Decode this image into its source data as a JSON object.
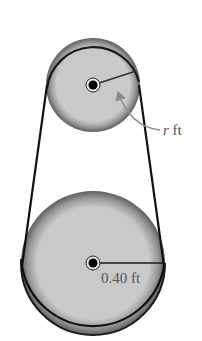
{
  "diagram": {
    "type": "belt-and-pulley",
    "small_pulley": {
      "label_var": "r",
      "label_unit": " ft",
      "cx": 93,
      "cy": 85,
      "r": 47
    },
    "large_pulley": {
      "label": "0.40 ft",
      "cx": 93,
      "cy": 263,
      "r": 72
    },
    "colors": {
      "belt": "#111111",
      "pulley_fill": "#c9c9c9",
      "pulley_rim": "#7a7a7a",
      "text": "#555555",
      "leader": "#8a8a8a"
    }
  }
}
